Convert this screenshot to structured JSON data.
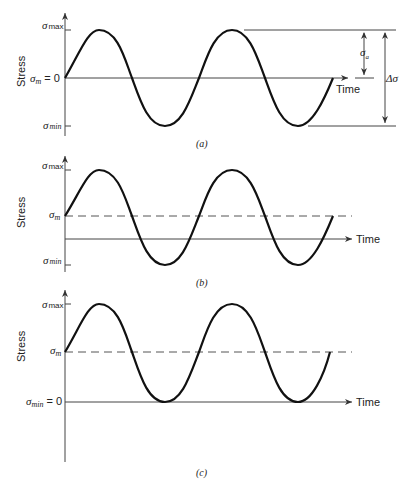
{
  "panels": [
    {
      "id": "a",
      "caption": "(a)",
      "ylabel": "Stress",
      "xlabel": "Time",
      "labels": {
        "max": "σ",
        "max_sub": "max",
        "mean": "σ",
        "mean_sub": "m",
        "mean_suffix": " = 0",
        "min": "σ",
        "min_sub": "min"
      },
      "annotations": {
        "amplitude": "σ",
        "amplitude_sub": "a",
        "range": "Δσ"
      }
    },
    {
      "id": "b",
      "caption": "(b)",
      "ylabel": "Stress",
      "xlabel": "Time",
      "labels": {
        "max": "σ",
        "max_sub": "max",
        "mean": "σ",
        "mean_sub": "m",
        "min": "σ",
        "min_sub": "min"
      }
    },
    {
      "id": "c",
      "caption": "(c)",
      "ylabel": "Stress",
      "xlabel": "Time",
      "labels": {
        "max": "σ",
        "max_sub": "max",
        "mean": "σ",
        "mean_sub": "m",
        "min": "σ",
        "min_sub": "min",
        "min_suffix": " = 0"
      }
    }
  ]
}
